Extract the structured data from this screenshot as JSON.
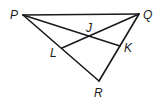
{
  "diagram": {
    "type": "geometry-triangle",
    "points": {
      "P": {
        "label": "P",
        "x": 23,
        "y": 15
      },
      "Q": {
        "label": "Q",
        "x": 139,
        "y": 14
      },
      "R": {
        "label": "R",
        "x": 99,
        "y": 81
      },
      "L": {
        "label": "L",
        "x": 62,
        "y": 48
      },
      "K": {
        "label": "K",
        "x": 120,
        "y": 46
      },
      "J": {
        "label": "J",
        "x": 88,
        "y": 36
      }
    },
    "segments": [
      "PQ",
      "PR",
      "QR",
      "PK",
      "QL"
    ],
    "labels": {
      "P": "P",
      "Q": "Q",
      "R": "R",
      "L": "L",
      "K": "K",
      "J": "J"
    }
  }
}
